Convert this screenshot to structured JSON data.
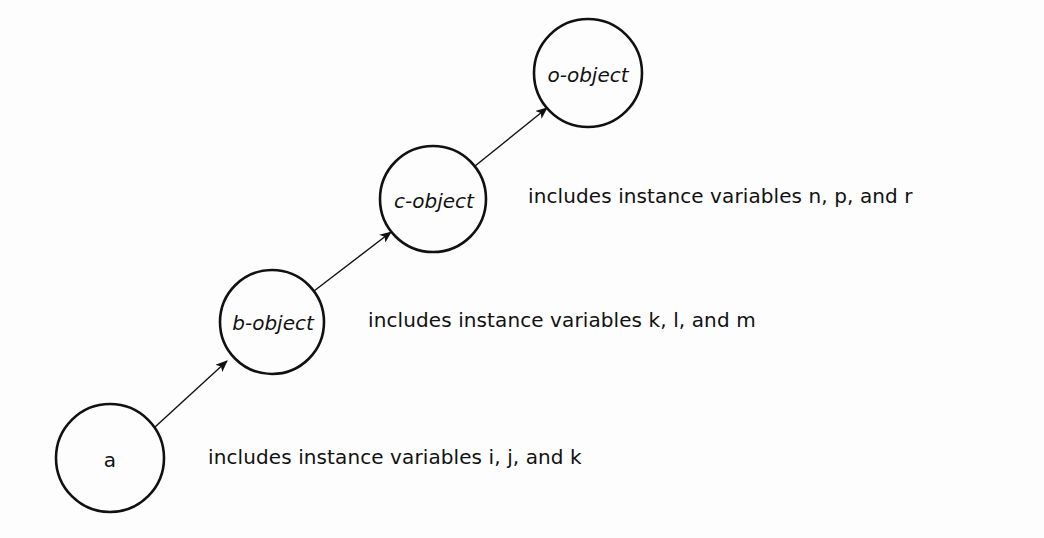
{
  "diagram": {
    "type": "object inheritance chain",
    "nodes": [
      {
        "id": "a",
        "label": "a",
        "italic": false,
        "cx": 110,
        "cy": 458,
        "r": 54,
        "description": "includes instance variables i, j, and k"
      },
      {
        "id": "b-object",
        "label": "b-object",
        "italic": true,
        "cx": 272,
        "cy": 322,
        "r": 52,
        "description": "includes instance variables k, l, and m"
      },
      {
        "id": "c-object",
        "label": "c-object",
        "italic": true,
        "cx": 433,
        "cy": 199,
        "r": 53,
        "description": "includes instance variables n, p, and r"
      },
      {
        "id": "o-object",
        "label": "o-object",
        "italic": true,
        "cx": 588,
        "cy": 73,
        "r": 54,
        "description": ""
      }
    ],
    "edges": [
      {
        "from": "a",
        "to": "b-object",
        "arrow": "end"
      },
      {
        "from": "b-object",
        "to": "c-object",
        "arrow": "end"
      },
      {
        "from": "c-object",
        "to": "o-object",
        "arrow": "end"
      }
    ],
    "colors": {
      "stroke": "#111111",
      "background": "#fdfdfd"
    }
  }
}
